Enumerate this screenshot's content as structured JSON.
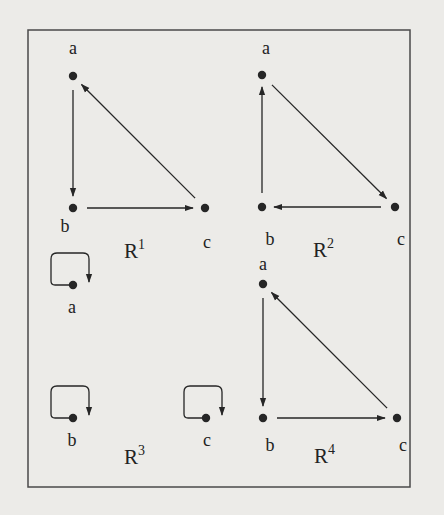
{
  "figure": {
    "frame": {
      "x": 28,
      "y": 30,
      "w": 382,
      "h": 457
    },
    "colors": {
      "background": "#ecebe8",
      "ink": "#262626",
      "frame": "#4a4a4a"
    },
    "graphs": [
      {
        "id": "R1",
        "label_base": "R",
        "label_sup": "1",
        "label_pos": [
          124,
          258
        ],
        "nodes": [
          {
            "id": "a",
            "label": "a",
            "x": 73,
            "y": 76,
            "lx": 73,
            "ly": 54
          },
          {
            "id": "b",
            "label": "b",
            "x": 73,
            "y": 208,
            "lx": 65,
            "ly": 232
          },
          {
            "id": "c",
            "label": "c",
            "x": 205,
            "y": 208,
            "lx": 207,
            "ly": 248
          }
        ],
        "edges": [
          {
            "from": "a",
            "to": "b",
            "type": "straight"
          },
          {
            "from": "b",
            "to": "c",
            "type": "straight"
          },
          {
            "from": "c",
            "to": "a",
            "type": "straight"
          }
        ]
      },
      {
        "id": "R2",
        "label_base": "R",
        "label_sup": "2",
        "label_pos": [
          313,
          257
        ],
        "nodes": [
          {
            "id": "a",
            "label": "a",
            "x": 262,
            "y": 75,
            "lx": 266,
            "ly": 54
          },
          {
            "id": "b",
            "label": "b",
            "x": 262,
            "y": 207,
            "lx": 270,
            "ly": 245
          },
          {
            "id": "c",
            "label": "c",
            "x": 395,
            "y": 207,
            "lx": 401,
            "ly": 245
          }
        ],
        "edges": [
          {
            "from": "a",
            "to": "c",
            "type": "straight"
          },
          {
            "from": "c",
            "to": "b",
            "type": "straight"
          },
          {
            "from": "b",
            "to": "a",
            "type": "straight"
          }
        ]
      },
      {
        "id": "R3",
        "label_base": "R",
        "label_sup": "3",
        "label_pos": [
          124,
          464
        ],
        "nodes": [
          {
            "id": "a",
            "label": "a",
            "x": 73,
            "y": 285,
            "lx": 72,
            "ly": 313
          },
          {
            "id": "b",
            "label": "b",
            "x": 73,
            "y": 418,
            "lx": 72,
            "ly": 446
          },
          {
            "id": "c",
            "label": "c",
            "x": 206,
            "y": 418,
            "lx": 207,
            "ly": 446
          }
        ],
        "edges": [
          {
            "from": "a",
            "to": "a",
            "type": "loop"
          },
          {
            "from": "b",
            "to": "b",
            "type": "loop"
          },
          {
            "from": "c",
            "to": "c",
            "type": "loop"
          }
        ]
      },
      {
        "id": "R4",
        "label_base": "R",
        "label_sup": "4",
        "label_pos": [
          314,
          463
        ],
        "nodes": [
          {
            "id": "a",
            "label": "a",
            "x": 263,
            "y": 284,
            "lx": 263,
            "ly": 270
          },
          {
            "id": "b",
            "label": "b",
            "x": 263,
            "y": 418,
            "lx": 270,
            "ly": 451
          },
          {
            "id": "c",
            "label": "c",
            "x": 397,
            "y": 418,
            "lx": 403,
            "ly": 451
          }
        ],
        "edges": [
          {
            "from": "a",
            "to": "b",
            "type": "straight"
          },
          {
            "from": "b",
            "to": "c",
            "type": "straight"
          },
          {
            "from": "c",
            "to": "a",
            "type": "straight"
          }
        ]
      }
    ]
  }
}
